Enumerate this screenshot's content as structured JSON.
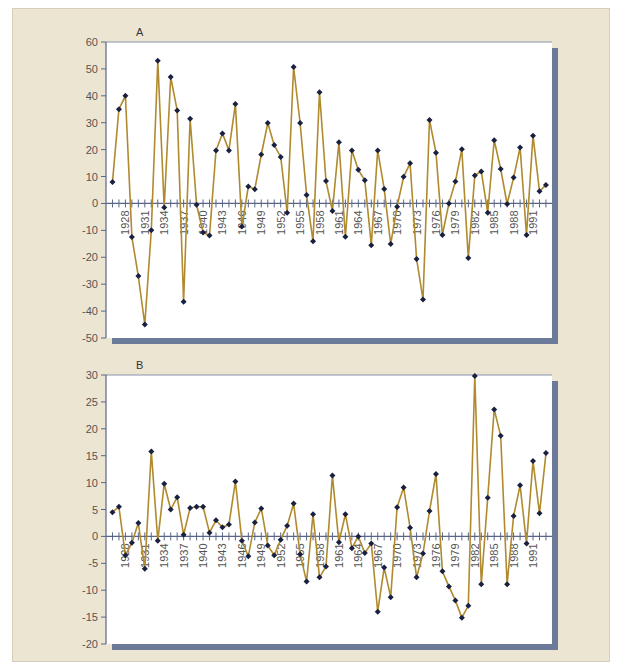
{
  "figure": {
    "background": "#ece5d2",
    "plot_background": "#ffffff",
    "line_color": "#b08a2e",
    "marker_color": "#1a2040",
    "axis_color": "#5a6688",
    "shadow_color": "#6b7a99"
  },
  "chart_data": [
    {
      "type": "line",
      "panel_label": "A",
      "title": "",
      "xlabel": "",
      "ylabel": "",
      "ylim": [
        -50,
        60
      ],
      "yticks": [
        60,
        50,
        40,
        30,
        20,
        10,
        0,
        -10,
        -20,
        -30,
        -40,
        -50
      ],
      "x_tick_labels": [
        "1928",
        "1931",
        "1934",
        "1937",
        "1940",
        "1943",
        "1946",
        "1949",
        "1952",
        "1955",
        "1958",
        "1961",
        "1964",
        "1967",
        "1970",
        "1973",
        "1976",
        "1979",
        "1982",
        "1985",
        "1988",
        "1991"
      ],
      "grid": false,
      "markers": true,
      "x": [
        1926,
        1927,
        1928,
        1929,
        1930,
        1931,
        1932,
        1933,
        1934,
        1935,
        1936,
        1937,
        1938,
        1939,
        1940,
        1941,
        1942,
        1943,
        1944,
        1945,
        1946,
        1947,
        1948,
        1949,
        1950,
        1951,
        1952,
        1953,
        1954,
        1955,
        1956,
        1957,
        1958,
        1959,
        1960,
        1961,
        1962,
        1963,
        1964,
        1965,
        1966,
        1967,
        1968,
        1969,
        1970,
        1971,
        1972,
        1973,
        1974,
        1975,
        1976,
        1977,
        1978,
        1979,
        1980,
        1981,
        1982,
        1983,
        1984,
        1985,
        1986,
        1987,
        1988,
        1989,
        1990,
        1991,
        1992,
        1993
      ],
      "values": [
        8,
        35,
        40,
        -12.5,
        -27,
        -45,
        -10,
        53,
        -1.5,
        47,
        34.5,
        -36.5,
        31.5,
        -0.5,
        -10.8,
        -11.9,
        19.7,
        26,
        19.7,
        37,
        -8.6,
        6.3,
        5.3,
        18.2,
        29.9,
        21.7,
        17.3,
        -3.5,
        50.7,
        29.9,
        3.1,
        -14,
        41.3,
        8.3,
        -2.8,
        22.7,
        -12.4,
        19.7,
        12.5,
        8.6,
        -15.5,
        19.7,
        5.4,
        -15.1,
        -1.2,
        9.9,
        14.9,
        -20.6,
        -35.7,
        31,
        18.8,
        -11.7,
        0,
        8.2,
        20.1,
        -20.3,
        10.4,
        11.9,
        -3.5,
        23.5,
        12.8,
        -0.2,
        9.6,
        20.8,
        -11.7,
        25.2,
        4.5,
        6.9
      ]
    },
    {
      "type": "line",
      "panel_label": "B",
      "title": "",
      "xlabel": "",
      "ylabel": "",
      "ylim": [
        -20,
        30
      ],
      "yticks": [
        30,
        25,
        20,
        15,
        10,
        5,
        0,
        -5,
        -10,
        -15,
        -20
      ],
      "x_tick_labels": [
        "1928",
        "1931",
        "1934",
        "1937",
        "1940",
        "1943",
        "1946",
        "1949",
        "1952",
        "1955",
        "1958",
        "1961",
        "1964",
        "1967",
        "1970",
        "1973",
        "1976",
        "1979",
        "1982",
        "1985",
        "1988",
        "1991"
      ],
      "grid": false,
      "markers": true,
      "x": [
        1926,
        1927,
        1928,
        1929,
        1930,
        1931,
        1932,
        1933,
        1934,
        1935,
        1936,
        1937,
        1938,
        1939,
        1940,
        1941,
        1942,
        1943,
        1944,
        1945,
        1946,
        1947,
        1948,
        1949,
        1950,
        1951,
        1952,
        1953,
        1954,
        1955,
        1956,
        1957,
        1958,
        1959,
        1960,
        1961,
        1962,
        1963,
        1964,
        1965,
        1966,
        1967,
        1968,
        1969,
        1970,
        1971,
        1972,
        1973,
        1974,
        1975,
        1976,
        1977,
        1978,
        1979,
        1980,
        1981,
        1982,
        1983,
        1984,
        1985,
        1986,
        1987,
        1988,
        1989,
        1990,
        1991,
        1992,
        1993
      ],
      "values": [
        4.5,
        5.5,
        -3.5,
        -1.2,
        2.5,
        -6,
        15.8,
        -0.8,
        9.8,
        5,
        7.3,
        0.3,
        5.3,
        5.5,
        5.5,
        0.7,
        3,
        1.7,
        2.2,
        10.2,
        -0.8,
        -3.7,
        2.6,
        5.2,
        -1.7,
        -3.5,
        -0.6,
        2,
        6.1,
        -3.3,
        -8.4,
        4.1,
        -7.6,
        -5.6,
        11.3,
        -1.1,
        4.1,
        -2.2,
        0,
        -3.1,
        -1.3,
        -14,
        -5.8,
        -11.3,
        5.4,
        9.1,
        1.6,
        -7.6,
        -3.2,
        4.7,
        11.6,
        -6.5,
        -9.3,
        -11.9,
        -15.1,
        -12.9,
        29.8,
        -8.9,
        7.2,
        23.6,
        18.7,
        -8.9,
        3.8,
        9.5,
        -1.3,
        14,
        4.3,
        15.5
      ]
    }
  ]
}
